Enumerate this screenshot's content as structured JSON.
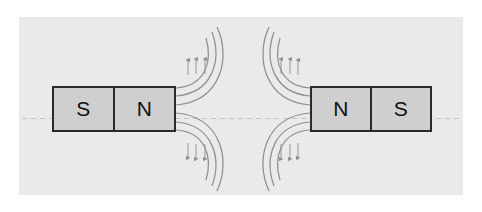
{
  "figure": {
    "background_color": "#ffffff",
    "panel_color": "#e9eaea",
    "magnet_fill": "#cfcfcf",
    "magnet_border": "#2a2a2a",
    "field_line_color": "#8d8f94",
    "axis_line_color": "#b9bbbd"
  },
  "magnets": [
    {
      "id": "left",
      "poles": [
        {
          "label": "S"
        },
        {
          "label": "N"
        }
      ]
    },
    {
      "id": "right",
      "poles": [
        {
          "label": "N"
        },
        {
          "label": "S"
        }
      ]
    }
  ],
  "field": {
    "arrow_direction_top": "up",
    "arrow_direction_bottom": "down",
    "lines_per_group": 3,
    "groups": 4
  }
}
